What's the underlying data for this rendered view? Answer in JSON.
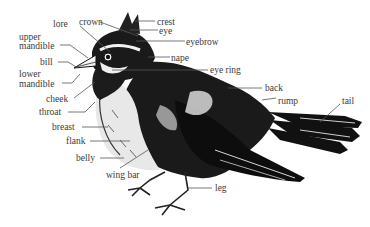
{
  "diagram": {
    "labels": {
      "crown": "crown",
      "crest": "crest",
      "eye": "eye",
      "eyebrow": "eyebrow",
      "lore": "lore",
      "upper_mandible_1": "upper",
      "upper_mandible_2": "mandible",
      "bill": "bill",
      "lower_mandible_1": "lower",
      "lower_mandible_2": "mandible",
      "nape": "nape",
      "eye_ring": "eye ring",
      "back": "back",
      "rump": "rump",
      "tail": "tail",
      "cheek": "cheek",
      "throat": "throat",
      "breast": "breast",
      "flank": "flank",
      "belly": "belly",
      "wing_bar": "wing bar",
      "leg": "leg"
    },
    "colors": {
      "ink": "#111111",
      "label": "#3a3a3a",
      "leader": "#555555",
      "background": "#ffffff"
    }
  }
}
